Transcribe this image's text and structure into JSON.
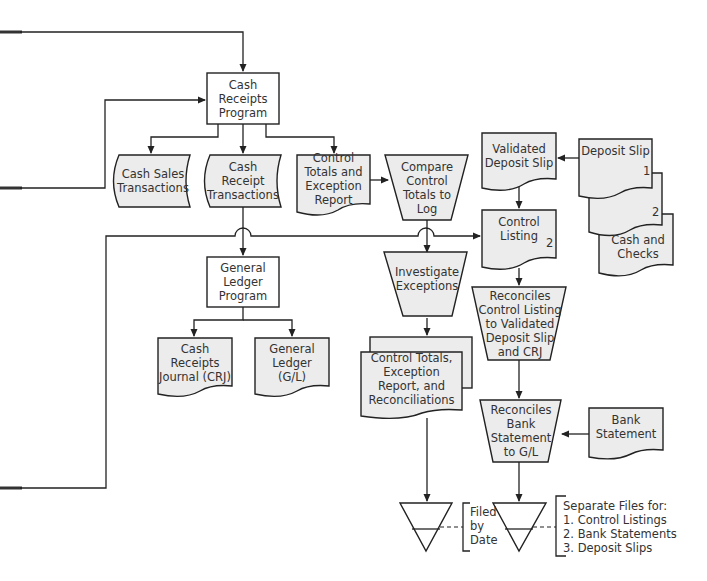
{
  "diagram": {
    "type": "flowchart",
    "title": "",
    "nodes": {
      "cash_receipts_program": {
        "label": "Cash Receipts Program",
        "shape": "process-box"
      },
      "cash_sales_transactions": {
        "label": "Cash Sales Transactions",
        "shape": "magnetic-tape"
      },
      "cash_receipt_transactions": {
        "label": "Cash Receipt Transactions",
        "shape": "magnetic-tape"
      },
      "control_totals_exception_report": {
        "label": "Control Totals and Exception Report",
        "shape": "document"
      },
      "compare_control_totals": {
        "label": "Compare Control Totals to Log",
        "shape": "manual-operation"
      },
      "validated_deposit_slip": {
        "label": "Validated Deposit Slip",
        "shape": "document"
      },
      "deposit_slip": {
        "label": "Deposit Slip",
        "number": "1",
        "shape": "document"
      },
      "deposit_slip_copy2": {
        "label": "",
        "number": "2",
        "shape": "document"
      },
      "cash_and_checks": {
        "label": "Cash and Checks",
        "shape": "document"
      },
      "control_listing": {
        "label": "Control Listing",
        "number": "2",
        "shape": "document"
      },
      "general_ledger_program": {
        "label": "General Ledger Program",
        "shape": "process-box"
      },
      "investigate_exceptions": {
        "label": "Investigate Exceptions",
        "shape": "manual-operation"
      },
      "reconciles_control_listing": {
        "label": "Reconciles Control Listing to Validated Deposit Slip and CRJ",
        "shape": "manual-operation"
      },
      "cash_receipts_journal": {
        "label": "Cash Receipts Journal (CRJ)",
        "shape": "document"
      },
      "general_ledger": {
        "label": "General Ledger (G/L)",
        "shape": "document"
      },
      "control_totals_reports": {
        "label": "Control Totals, Exception Report, and Reconciliations",
        "shape": "multi-document"
      },
      "reconciles_bank_statement": {
        "label": "Reconciles Bank Statement to G/L",
        "shape": "manual-operation"
      },
      "bank_statement": {
        "label": "Bank Statement",
        "shape": "document"
      },
      "file_1": {
        "label": "",
        "shape": "offline-file"
      },
      "file_2": {
        "label": "",
        "shape": "offline-file"
      }
    },
    "annotations": {
      "filed_by_date": {
        "lines": [
          "Filed",
          "by",
          "Date"
        ]
      },
      "separate_files": {
        "lines": [
          "Separate Files for:",
          "1. Control Listings",
          "2. Bank Statements",
          "3. Deposit Slips"
        ]
      }
    },
    "edges": [
      {
        "from": "off-page-left-top",
        "to": "cash_receipts_program"
      },
      {
        "from": "off-page-left-mid",
        "to": "cash_receipts_program"
      },
      {
        "from": "cash_receipts_program",
        "to": "cash_sales_transactions"
      },
      {
        "from": "cash_receipts_program",
        "to": "cash_receipt_transactions"
      },
      {
        "from": "cash_receipts_program",
        "to": "control_totals_exception_report"
      },
      {
        "from": "control_totals_exception_report",
        "to": "compare_control_totals"
      },
      {
        "from": "cash_receipt_transactions",
        "to": "general_ledger_program"
      },
      {
        "from": "off-page-left-bottom",
        "to": "control_listing"
      },
      {
        "from": "compare_control_totals",
        "to": "investigate_exceptions"
      },
      {
        "from": "deposit_slip",
        "to": "validated_deposit_slip"
      },
      {
        "from": "validated_deposit_slip",
        "to": "control_listing"
      },
      {
        "from": "control_listing",
        "to": "reconciles_control_listing"
      },
      {
        "from": "general_ledger_program",
        "to": "cash_receipts_journal"
      },
      {
        "from": "general_ledger_program",
        "to": "general_ledger"
      },
      {
        "from": "investigate_exceptions",
        "to": "control_totals_reports"
      },
      {
        "from": "reconciles_control_listing",
        "to": "reconciles_bank_statement"
      },
      {
        "from": "bank_statement",
        "to": "reconciles_bank_statement"
      },
      {
        "from": "control_totals_reports",
        "to": "file_1"
      },
      {
        "from": "reconciles_bank_statement",
        "to": "file_2"
      }
    ]
  }
}
